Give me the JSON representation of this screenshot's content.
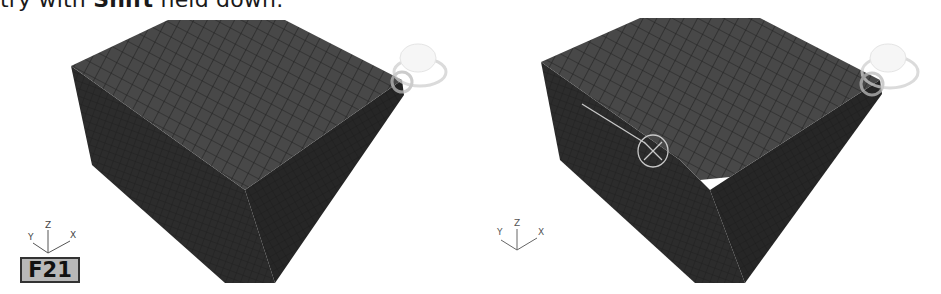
{
  "caption": {
    "prefix": "try with ",
    "bold": "Shift",
    "suffix": " held down."
  },
  "viewports": [
    {
      "name": "left-viewport",
      "object": "box-mesh",
      "axis_labels": {
        "z": "Z",
        "y": "Y",
        "x": "X"
      },
      "badge": "F21"
    },
    {
      "name": "right-viewport",
      "object": "box-mesh-chamfered",
      "axis_labels": {
        "z": "Z",
        "y": "Y",
        "x": "X"
      },
      "gizmo": "transform-gizmo-circle"
    }
  ],
  "colors": {
    "mesh_top": "#474747",
    "mesh_side_left": "#2e2e2e",
    "mesh_side_front": "#262626",
    "grid_line": "#1c1c1c",
    "gizmo": "#bdbdbd",
    "badge_bg": "#b8b8b8"
  }
}
